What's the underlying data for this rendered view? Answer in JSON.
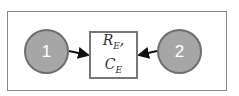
{
  "diagram": {
    "nodes": [
      {
        "id": "1",
        "label": "1",
        "shape": "circle"
      },
      {
        "id": "2",
        "label": "2",
        "shape": "circle"
      }
    ],
    "center": {
      "line1_main": "R",
      "line1_sub": "E",
      "line1_suffix": ",",
      "line2_main": "C",
      "line2_sub": "E"
    },
    "edges": [
      {
        "from": "1",
        "to": "center"
      },
      {
        "from": "2",
        "to": "center"
      }
    ],
    "colors": {
      "node_fill": "#a6a6a6",
      "node_border": "#6f6f6f",
      "box_border": "#777777",
      "arrow": "#111111"
    }
  }
}
